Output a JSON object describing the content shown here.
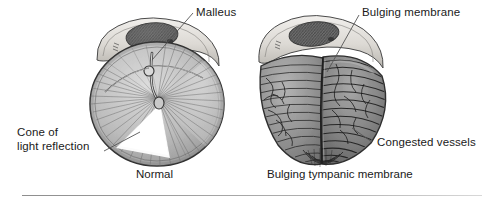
{
  "figure": {
    "type": "medical-illustration",
    "panels": [
      {
        "id": "normal",
        "caption": "Normal",
        "labels": [
          "Malleus",
          "Cone of light reflection"
        ]
      },
      {
        "id": "bulging",
        "caption": "Bulging tympanic membrane",
        "labels": [
          "Bulging membrane",
          "Congested vessels"
        ]
      }
    ]
  },
  "labels": {
    "malleus": "Malleus",
    "cone_line1": "Cone of",
    "cone_line2": "light reflection",
    "bulging_membrane": "Bulging membrane",
    "congested_vessels": "Congested vessels"
  },
  "captions": {
    "normal": "Normal",
    "bulging": "Bulging tympanic membrane"
  },
  "colors": {
    "background": "#ffffff",
    "text": "#1a1a1a",
    "leader_line": "#5a5a5a",
    "membrane_light": "#d2d2d2",
    "membrane_mid": "#9a9a9a",
    "membrane_dark": "#6d6d6d",
    "bone_rim": "#e2e0dc",
    "pars_flaccida": "#6a6a6a",
    "cone_of_light": "#fdfdfd",
    "outline": "#3a3a3a",
    "rule": "#9a9a9a"
  }
}
